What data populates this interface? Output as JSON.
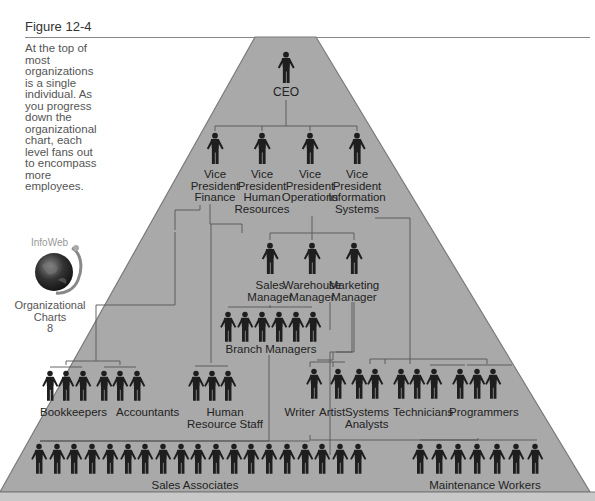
{
  "figure": {
    "title": "Figure 12-4",
    "caption": "At the top of most organizations is a single individual. As you progress down the organizational chart, each level fans out to encompass more employees."
  },
  "infoweb": {
    "logo_text": "InfoWeb",
    "label_line1": "Organizational",
    "label_line2": "Charts",
    "label_number": "8"
  },
  "colors": {
    "pyramid_fill": "#a9a9a9",
    "pyramid_edge": "#777777",
    "figure_color": "#1e1e1e",
    "line_color": "#555555"
  },
  "chart": {
    "ceo": {
      "label": "CEO",
      "count": 1
    },
    "vice_presidents": [
      {
        "line1": "Vice",
        "line2": "President",
        "line3": "Finance",
        "line4": ""
      },
      {
        "line1": "Vice",
        "line2": "President",
        "line3": "Human",
        "line4": "Resources"
      },
      {
        "line1": "Vice",
        "line2": "President",
        "line3": "Operations",
        "line4": ""
      },
      {
        "line1": "Vice",
        "line2": "President",
        "line3": "Information",
        "line4": "Systems"
      }
    ],
    "managers": [
      {
        "line1": "Sales",
        "line2": "Manager"
      },
      {
        "line1": "Warehouse",
        "line2": "Manager"
      },
      {
        "line1": "Marketing",
        "line2": "Manager"
      }
    ],
    "branch_managers": {
      "label": "Branch Managers",
      "count": 6
    },
    "staff": [
      {
        "line1": "Bookkeepers",
        "line2": "",
        "count": 3
      },
      {
        "line1": "Accountants",
        "line2": "",
        "count": 3
      },
      {
        "line1": "Human",
        "line2": "Resource Staff",
        "count": 3
      },
      {
        "line1": "Writer",
        "line2": "",
        "count": 1
      },
      {
        "line1": "Artist",
        "line2": "",
        "count": 1
      },
      {
        "line1": "Systems",
        "line2": "Analysts",
        "count": 2
      },
      {
        "line1": "Technicians",
        "line2": "",
        "count": 3
      },
      {
        "line1": "Programmers",
        "line2": "",
        "count": 3
      }
    ],
    "sales_associates": {
      "label": "Sales Associates",
      "count": 19
    },
    "maintenance_workers": {
      "label": "Maintenance Workers",
      "count": 7
    }
  }
}
